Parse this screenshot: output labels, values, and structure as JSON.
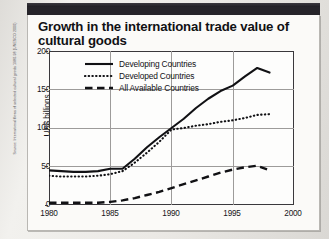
{
  "figure": {
    "title": "Growth in the international trade value of cultural goods",
    "source_credit": "Source: International flows of selected cultural goods 1980-98 (UNESCO 2000)"
  },
  "colors": {
    "ink": "#16151a",
    "header_band": "#26242a",
    "card_bg": "#fbfaf8",
    "grid": "#9d9b9a",
    "paper": "#eceae6"
  },
  "legend": {
    "position": "top-left-inside",
    "items": [
      {
        "label": "Developing Countries",
        "style": "solid",
        "icon": "solid-line-icon"
      },
      {
        "label": "Developed Countries",
        "style": "dotted",
        "icon": "dotted-line-icon"
      },
      {
        "label": "All Available Countries",
        "style": "dashed",
        "icon": "dashed-line-icon"
      }
    ]
  },
  "chart_data": {
    "type": "line",
    "title": "Growth in the international trade value of cultural goods",
    "xlabel": "",
    "ylabel": "US$ billions",
    "xlim": [
      1980,
      2000
    ],
    "ylim": [
      0,
      200
    ],
    "xticks": [
      1980,
      1985,
      1990,
      1995,
      2000
    ],
    "yticks": [
      0,
      50,
      100,
      150,
      200
    ],
    "grid": true,
    "x": [
      1980,
      1981,
      1982,
      1983,
      1984,
      1985,
      1986,
      1987,
      1988,
      1989,
      1990,
      1991,
      1992,
      1993,
      1994,
      1995,
      1996,
      1997,
      1998
    ],
    "series": [
      {
        "name": "Developing Countries",
        "style": "solid",
        "values": [
          45,
          44,
          43,
          43,
          44,
          47,
          47,
          60,
          75,
          88,
          100,
          112,
          126,
          138,
          148,
          155,
          167,
          178,
          172
        ]
      },
      {
        "name": "Developed Countries",
        "style": "dotted",
        "values": [
          38,
          37,
          37,
          37,
          38,
          40,
          44,
          55,
          68,
          82,
          98,
          100,
          103,
          105,
          108,
          110,
          113,
          117,
          118
        ]
      },
      {
        "name": "All Available Countries",
        "style": "dashed",
        "values": [
          3,
          3,
          3,
          3,
          3,
          4,
          6,
          9,
          13,
          17,
          22,
          27,
          32,
          37,
          42,
          46,
          49,
          51,
          45
        ]
      }
    ]
  }
}
